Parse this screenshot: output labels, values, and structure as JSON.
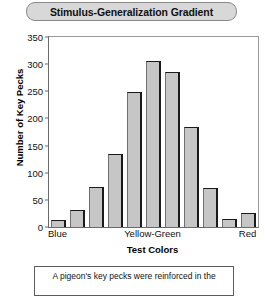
{
  "title": "Stimulus-Generalization Gradient",
  "caption": "A pigeon's key pecks were reinforced in the",
  "chart_data": {
    "type": "bar",
    "title": "Stimulus-Generalization Gradient",
    "xlabel": "Test Colors",
    "ylabel": "Number of Key Pecks",
    "ylim": [
      0,
      350
    ],
    "yticks": [
      0,
      50,
      100,
      150,
      200,
      250,
      300,
      350
    ],
    "ytick_labels": [
      "0",
      "50",
      "100",
      "150",
      "200",
      "250",
      "300",
      "350"
    ],
    "xtick_labels": [
      "Blue",
      "Yellow-Green",
      "Red"
    ],
    "xtick_positions": [
      1,
      6,
      11
    ],
    "grid": false,
    "legend": null,
    "categories": [
      "1",
      "2",
      "3",
      "4",
      "5",
      "6",
      "7",
      "8",
      "9",
      "10",
      "11"
    ],
    "values": [
      13,
      32,
      73,
      135,
      248,
      305,
      285,
      185,
      72,
      14,
      25
    ]
  }
}
